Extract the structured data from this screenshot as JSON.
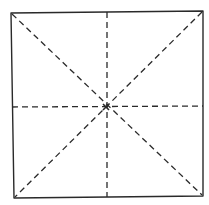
{
  "diagram": {
    "type": "folded-square-crease-pattern",
    "stroke_color": "#2a2a2a",
    "background": "#ffffff",
    "outline": {
      "points": [
        [
          11,
          13
        ],
        [
          203,
          11
        ],
        [
          203,
          196
        ],
        [
          14,
          198
        ]
      ]
    },
    "center": [
      106,
      107
    ],
    "fold_lines": [
      {
        "name": "diagonal-tl-br",
        "from": [
          12,
          14
        ],
        "to": [
          202,
          195
        ]
      },
      {
        "name": "diagonal-tr-bl",
        "from": [
          202,
          12
        ],
        "to": [
          15,
          197
        ]
      },
      {
        "name": "vertical-midline",
        "from": [
          107,
          12
        ],
        "to": [
          107,
          197
        ]
      },
      {
        "name": "horizontal-midline",
        "from": [
          12,
          107
        ],
        "to": [
          203,
          106
        ]
      }
    ],
    "dash_pattern": "6 4"
  }
}
